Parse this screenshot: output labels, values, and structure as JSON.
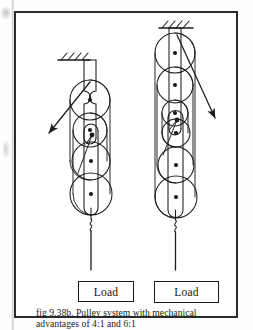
{
  "figure": {
    "caption_line1": "fig 9.38b. Pulley system with mechanical",
    "caption_line2": "advantages of 4:1 and 6:1",
    "caption_full": "fig 9.38b. Pulley system with mechanical advantages of 4:1 and 6:1",
    "figure_number": "9.38b",
    "border_color": "#2b2b2b",
    "ink_color": "#1c1c1c",
    "page_color": "#ffffff"
  },
  "systems": [
    {
      "id": "left",
      "name": "pulley-system-left",
      "mechanical_advantage": "4:1",
      "pulley_count": 4,
      "upper_block_pulleys": 2,
      "lower_block_pulleys": 2,
      "load_label": "Load",
      "effort_arrow_direction": "down-left",
      "ceiling_hatch": true
    },
    {
      "id": "right",
      "name": "pulley-system-right",
      "mechanical_advantage": "6:1",
      "pulley_count": 6,
      "upper_block_pulleys": 3,
      "lower_block_pulleys": 3,
      "load_label": "Load",
      "effort_arrow_direction": "down-right",
      "ceiling_hatch": true
    }
  ],
  "labels": {
    "load_left": "Load",
    "load_right": "Load"
  }
}
